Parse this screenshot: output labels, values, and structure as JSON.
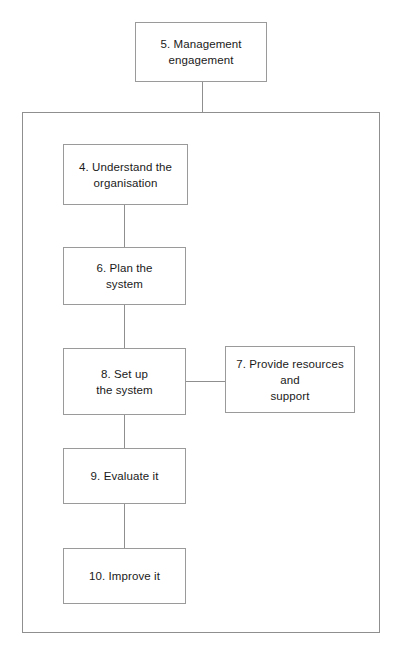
{
  "diagram": {
    "title_text": "Management system implementation flow",
    "nodes": [
      {
        "id": "node-5",
        "name": "node-management-engagement",
        "label": "5. Management\nengagement",
        "x": 135,
        "y": 22,
        "w": 132,
        "h": 60
      },
      {
        "id": "node-4",
        "name": "node-understand-the-organisation",
        "label": "4. Understand the\norganisation",
        "x": 63,
        "y": 144,
        "w": 125,
        "h": 61
      },
      {
        "id": "node-6",
        "name": "node-plan-the-system",
        "label": "6. Plan the\nsystem",
        "x": 63,
        "y": 247,
        "w": 123,
        "h": 58
      },
      {
        "id": "node-8",
        "name": "node-set-up-the-system",
        "label": "8. Set up\nthe system",
        "x": 63,
        "y": 348,
        "w": 123,
        "h": 67
      },
      {
        "id": "node-7",
        "name": "node-provide-resources-and-support",
        "label": "7. Provide resources\nand\nsupport",
        "x": 225,
        "y": 346,
        "w": 130,
        "h": 67
      },
      {
        "id": "node-9",
        "name": "node-evaluate-it",
        "label": "9. Evaluate it",
        "x": 63,
        "y": 448,
        "w": 123,
        "h": 56
      },
      {
        "id": "node-10",
        "name": "node-improve-it",
        "label": "10. Improve it",
        "x": 63,
        "y": 548,
        "w": 123,
        "h": 56
      }
    ],
    "group_box": {
      "name": "implementation-cycle-container",
      "x": 22,
      "y": 112,
      "w": 358,
      "h": 521
    },
    "connectors": [
      {
        "name": "connector-node5-to-container",
        "orientation": "v",
        "x": 202,
        "y": 82,
        "length": 30
      },
      {
        "name": "connector-node4-to-node6",
        "orientation": "v",
        "x": 124,
        "y": 205,
        "length": 42
      },
      {
        "name": "connector-node6-to-node8",
        "orientation": "v",
        "x": 124,
        "y": 305,
        "length": 43
      },
      {
        "name": "connector-node8-to-node9",
        "orientation": "v",
        "x": 124,
        "y": 415,
        "length": 33
      },
      {
        "name": "connector-node9-to-node10",
        "orientation": "v",
        "x": 124,
        "y": 504,
        "length": 44
      },
      {
        "name": "connector-node8-to-node7",
        "orientation": "h",
        "x": 186,
        "y": 381,
        "length": 39
      }
    ],
    "colors": {
      "node_border": "#9a9a9a",
      "container_border": "#8f8f8f",
      "connector": "#8f8f8f",
      "text": "#1a1a1a",
      "background": "#ffffff"
    }
  }
}
